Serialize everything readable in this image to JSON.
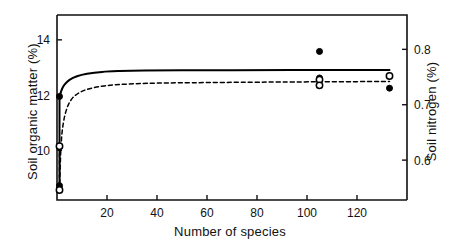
{
  "chart_data": {
    "type": "scatter",
    "title": "",
    "xlabel": "Number of species",
    "ylabel": "Soil organic matter  (%)",
    "y2label": "Soil nitrogen  (%)",
    "xlim": [
      0,
      140
    ],
    "ylim": [
      8.2,
      14.9
    ],
    "y2lim": [
      0.528,
      0.862
    ],
    "grid": false,
    "legend": "none",
    "xticks": [
      20,
      40,
      60,
      80,
      100,
      120
    ],
    "xticklabels": [
      "20",
      "40",
      "60",
      "80",
      "100",
      "120"
    ],
    "yticks": [
      10,
      12,
      14
    ],
    "yticklabels": [
      "10",
      "12",
      "14"
    ],
    "y2ticks": [
      0.6,
      0.7,
      0.8
    ],
    "y2ticklabels": [
      "0.6",
      "0.7",
      "0.8"
    ],
    "series": [
      {
        "name": "Soil organic matter",
        "marker": "filled-circle",
        "line": "solid",
        "axis": "left",
        "points": [
          {
            "x": 1,
            "y": 8.72
          },
          {
            "x": 1,
            "y": 11.95
          },
          {
            "x": 105,
            "y": 13.58
          },
          {
            "x": 105,
            "y": 12.62
          },
          {
            "x": 133,
            "y": 12.25
          }
        ],
        "curve": [
          {
            "x": 1.0,
            "y": 11.95
          },
          {
            "x": 2.0,
            "y": 12.22
          },
          {
            "x": 3.0,
            "y": 12.38
          },
          {
            "x": 5.0,
            "y": 12.55
          },
          {
            "x": 8.0,
            "y": 12.68
          },
          {
            "x": 12.0,
            "y": 12.77
          },
          {
            "x": 18.0,
            "y": 12.84
          },
          {
            "x": 25.0,
            "y": 12.87
          },
          {
            "x": 35.0,
            "y": 12.89
          },
          {
            "x": 50.0,
            "y": 12.9
          },
          {
            "x": 70.0,
            "y": 12.9
          },
          {
            "x": 100.0,
            "y": 12.91
          },
          {
            "x": 133.0,
            "y": 12.91
          }
        ]
      },
      {
        "name": "Soil nitrogen",
        "marker": "open-circle",
        "line": "dashed",
        "axis": "right",
        "points": [
          {
            "x": 1,
            "y": 0.546
          },
          {
            "x": 1,
            "y": 0.625
          },
          {
            "x": 105,
            "y": 0.745
          },
          {
            "x": 105,
            "y": 0.735
          },
          {
            "x": 133,
            "y": 0.752
          }
        ],
        "curve": [
          {
            "x": 1.0,
            "y": 0.546
          },
          {
            "x": 1.6,
            "y": 0.625
          },
          {
            "x": 2.5,
            "y": 0.666
          },
          {
            "x": 4.0,
            "y": 0.694
          },
          {
            "x": 6.0,
            "y": 0.711
          },
          {
            "x": 9.0,
            "y": 0.722
          },
          {
            "x": 13.0,
            "y": 0.729
          },
          {
            "x": 19.0,
            "y": 0.734
          },
          {
            "x": 27.0,
            "y": 0.737
          },
          {
            "x": 40.0,
            "y": 0.739
          },
          {
            "x": 60.0,
            "y": 0.74
          },
          {
            "x": 90.0,
            "y": 0.741
          },
          {
            "x": 133.0,
            "y": 0.742
          }
        ]
      }
    ]
  },
  "style": {
    "axis_color": "#111111",
    "series_color": "#000000",
    "background": "#ffffff"
  }
}
